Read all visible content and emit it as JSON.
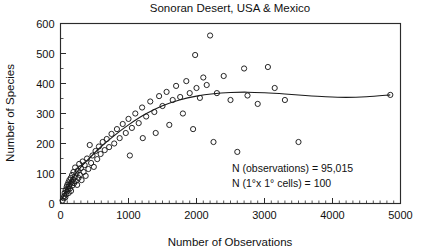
{
  "chart_data": {
    "type": "scatter",
    "title": "Sonoran Desert, USA & Mexico",
    "xlabel": "Number of Observations",
    "ylabel": "Number of Species",
    "xlim": [
      0,
      5000
    ],
    "ylim": [
      0,
      600
    ],
    "xticks": [
      0,
      1000,
      2000,
      3000,
      4000,
      5000
    ],
    "yticks": [
      0,
      100,
      200,
      300,
      400,
      500,
      600
    ],
    "xtick_labels": [
      "0",
      "1000",
      "2000",
      "3000",
      "4000",
      "5000"
    ],
    "ytick_labels": [
      "0",
      "100",
      "200",
      "300",
      "400",
      "500",
      "600"
    ],
    "x_minor_interval": 100,
    "y_minor_interval": 50,
    "grid": false,
    "legend": "none",
    "marker": "open-circle",
    "points": [
      [
        30,
        10
      ],
      [
        45,
        18
      ],
      [
        55,
        25
      ],
      [
        60,
        35
      ],
      [
        70,
        20
      ],
      [
        75,
        45
      ],
      [
        85,
        30
      ],
      [
        90,
        55
      ],
      [
        95,
        40
      ],
      [
        100,
        62
      ],
      [
        110,
        48
      ],
      [
        115,
        70
      ],
      [
        120,
        35
      ],
      [
        125,
        58
      ],
      [
        130,
        78
      ],
      [
        140,
        50
      ],
      [
        145,
        66
      ],
      [
        150,
        85
      ],
      [
        155,
        42
      ],
      [
        165,
        72
      ],
      [
        170,
        95
      ],
      [
        175,
        60
      ],
      [
        185,
        80
      ],
      [
        190,
        105
      ],
      [
        200,
        68
      ],
      [
        210,
        88
      ],
      [
        215,
        120
      ],
      [
        225,
        75
      ],
      [
        235,
        100
      ],
      [
        245,
        62
      ],
      [
        255,
        110
      ],
      [
        265,
        85
      ],
      [
        275,
        132
      ],
      [
        285,
        95
      ],
      [
        300,
        118
      ],
      [
        310,
        78
      ],
      [
        325,
        140
      ],
      [
        340,
        105
      ],
      [
        355,
        128
      ],
      [
        370,
        92
      ],
      [
        390,
        150
      ],
      [
        410,
        115
      ],
      [
        430,
        195
      ],
      [
        450,
        135
      ],
      [
        470,
        160
      ],
      [
        490,
        122
      ],
      [
        515,
        175
      ],
      [
        540,
        148
      ],
      [
        565,
        190
      ],
      [
        590,
        165
      ],
      [
        620,
        205
      ],
      [
        650,
        178
      ],
      [
        680,
        215
      ],
      [
        715,
        188
      ],
      [
        750,
        232
      ],
      [
        790,
        200
      ],
      [
        830,
        248
      ],
      [
        870,
        218
      ],
      [
        915,
        265
      ],
      [
        960,
        235
      ],
      [
        1000,
        282
      ],
      [
        1020,
        160
      ],
      [
        1050,
        252
      ],
      [
        1100,
        300
      ],
      [
        1150,
        268
      ],
      [
        1200,
        320
      ],
      [
        1210,
        218
      ],
      [
        1260,
        290
      ],
      [
        1320,
        340
      ],
      [
        1380,
        305
      ],
      [
        1400,
        235
      ],
      [
        1450,
        358
      ],
      [
        1500,
        325
      ],
      [
        1560,
        372
      ],
      [
        1600,
        262
      ],
      [
        1650,
        345
      ],
      [
        1700,
        392
      ],
      [
        1760,
        355
      ],
      [
        1800,
        300
      ],
      [
        1850,
        408
      ],
      [
        1900,
        368
      ],
      [
        1950,
        248
      ],
      [
        1980,
        495
      ],
      [
        2000,
        385
      ],
      [
        2050,
        352
      ],
      [
        2100,
        420
      ],
      [
        2150,
        395
      ],
      [
        2200,
        560
      ],
      [
        2250,
        205
      ],
      [
        2300,
        368
      ],
      [
        2400,
        425
      ],
      [
        2500,
        345
      ],
      [
        2600,
        172
      ],
      [
        2700,
        450
      ],
      [
        2750,
        360
      ],
      [
        2900,
        332
      ],
      [
        3050,
        455
      ],
      [
        3150,
        385
      ],
      [
        3300,
        345
      ],
      [
        3500,
        205
      ],
      [
        4850,
        362
      ]
    ],
    "fit_curve": [
      [
        20,
        12
      ],
      [
        120,
        62
      ],
      [
        260,
        110
      ],
      [
        420,
        150
      ],
      [
        600,
        190
      ],
      [
        800,
        228
      ],
      [
        1000,
        262
      ],
      [
        1250,
        298
      ],
      [
        1500,
        326
      ],
      [
        1750,
        345
      ],
      [
        2000,
        358
      ],
      [
        2250,
        366
      ],
      [
        2500,
        370
      ],
      [
        2750,
        371
      ],
      [
        3000,
        369
      ],
      [
        3300,
        365
      ],
      [
        3600,
        360
      ],
      [
        3900,
        356
      ],
      [
        4200,
        354
      ],
      [
        4500,
        356
      ],
      [
        4850,
        362
      ]
    ],
    "annotations": [
      {
        "line1": "N (observations)  =  95,015",
        "line2": "N (1°x 1° cells) =      100"
      }
    ]
  }
}
